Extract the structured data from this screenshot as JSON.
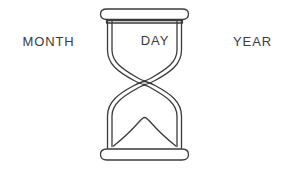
{
  "illustration": {
    "title": "hourglass-time-diagram",
    "background_color": "#ffffff",
    "line_color": "#3b3b3b",
    "stroke_width": 1.3
  },
  "labels": {
    "left": "MONTH",
    "center": "DAY",
    "right": "YEAR"
  },
  "hourglass": {
    "parts": [
      "top-cap",
      "upper-chamber",
      "neck",
      "lower-chamber",
      "sand-mound",
      "bottom-cap"
    ],
    "top_cap_color": "#ffffff",
    "bottom_cap_color": "#ffffff"
  }
}
